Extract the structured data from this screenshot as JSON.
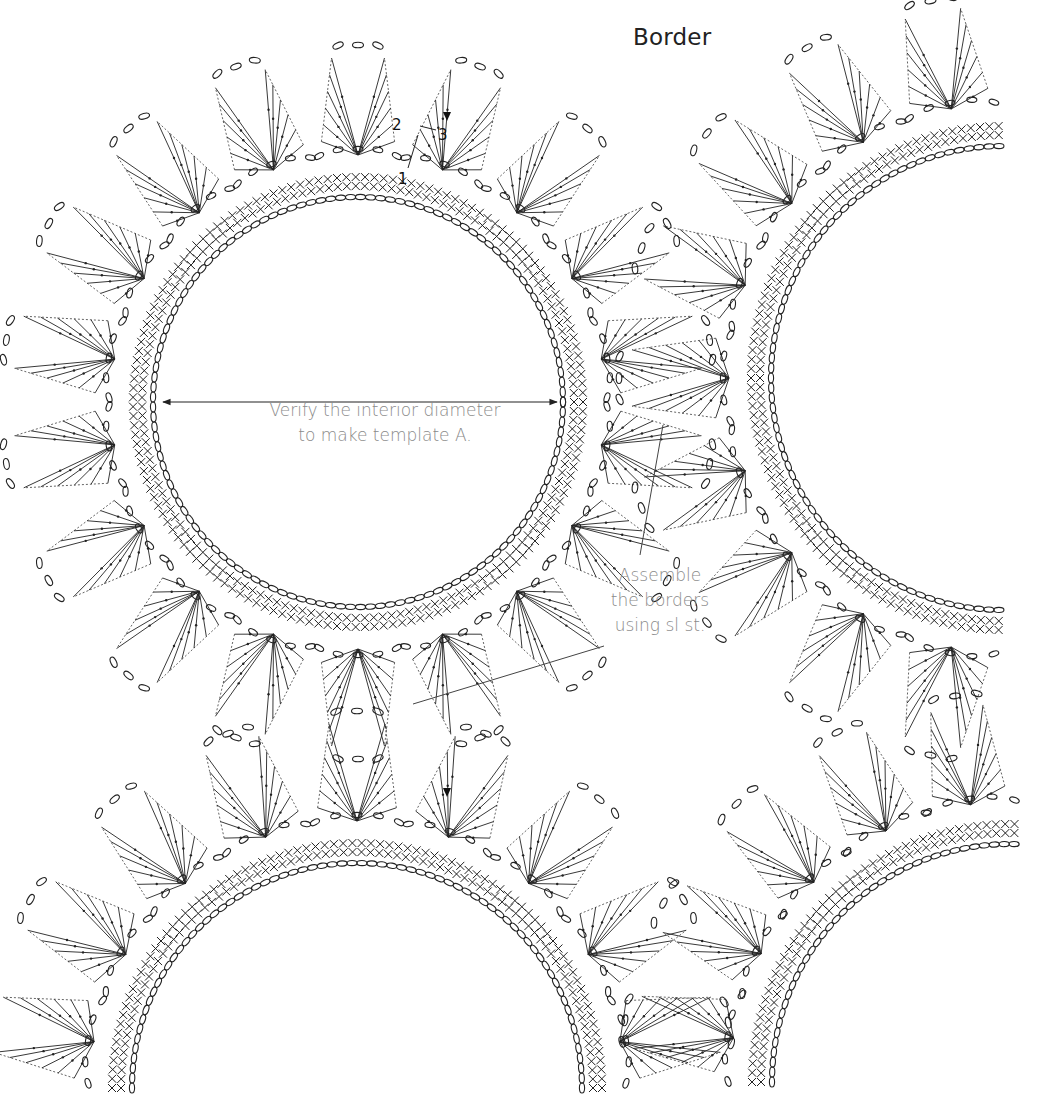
{
  "title": "Border",
  "annotations": {
    "diameter_note_line1": "Verify the interior diameter",
    "diameter_note_line2": "to make template A.",
    "assemble_note_line1": "Assemble",
    "assemble_note_line2": "the borders",
    "assemble_note_line3": "using sl st."
  },
  "step_labels": {
    "one": "1",
    "two": "2",
    "three": "3"
  },
  "colors": {
    "ink": "#222222",
    "note_text": "#8a8a8a",
    "background": "#ffffff"
  },
  "motifs": [
    {
      "name": "main-border",
      "cx": 358,
      "cy": 402,
      "r": 205,
      "start_deg": 0,
      "end_deg": 360,
      "points": 18
    },
    {
      "name": "right-border",
      "cx": 1003,
      "cy": 378,
      "r": 232,
      "start_deg": 91,
      "end_deg": 269,
      "points": 9
    },
    {
      "name": "bottom-left-border",
      "cx": 357,
      "cy": 1088,
      "r": 225,
      "start_deg": 180,
      "end_deg": 360,
      "points": 9
    },
    {
      "name": "bottom-right-border",
      "cx": 1010,
      "cy": 1082,
      "r": 238,
      "start_deg": 180,
      "end_deg": 271,
      "points": 5
    }
  ]
}
